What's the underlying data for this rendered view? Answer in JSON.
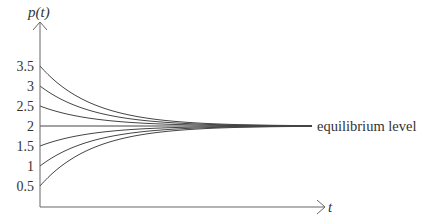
{
  "chart_data": {
    "type": "line",
    "title": "",
    "xlabel": "t",
    "ylabel": "p(t)",
    "yticks": [
      "0.5",
      "1",
      "1.5",
      "2",
      "2.5",
      "3",
      "3.5"
    ],
    "ylim": [
      0,
      4.5
    ],
    "grid": false,
    "legend": null,
    "equilibrium": 2,
    "annotations": [
      {
        "text": "equilibrium level",
        "y": 2
      }
    ],
    "series": [
      {
        "name": "p0=3.5",
        "initial": 3.5,
        "limit": 2
      },
      {
        "name": "p0=3",
        "initial": 3,
        "limit": 2
      },
      {
        "name": "p0=2.5",
        "initial": 2.5,
        "limit": 2
      },
      {
        "name": "p0=2",
        "initial": 2,
        "limit": 2
      },
      {
        "name": "p0=1.5",
        "initial": 1.5,
        "limit": 2
      },
      {
        "name": "p0=1",
        "initial": 1,
        "limit": 2
      },
      {
        "name": "p0=0.5",
        "initial": 0.5,
        "limit": 2
      }
    ]
  },
  "labels": {
    "y_axis": "p(t)",
    "x_axis": "t",
    "equilibrium": "equilibrium level"
  },
  "colors": {
    "axis": "#555555",
    "curve": "#444444",
    "text": "#333333"
  }
}
